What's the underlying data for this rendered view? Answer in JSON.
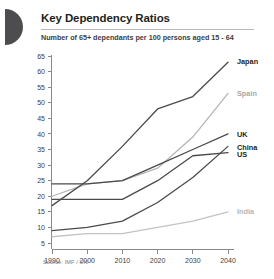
{
  "header": {
    "logo": "half-disc-mark",
    "title": "Key Dependency Ratios",
    "subtitle": "Number of 65+ dependants per 100 persons aged 15 - 64"
  },
  "footer": {
    "source": "Source: IMF / UN"
  },
  "chart_data": {
    "type": "line",
    "title": "Key Dependency Ratios",
    "subtitle": "Number of 65+ dependants per 100 persons aged 15 - 64",
    "xlabel": "",
    "ylabel": "",
    "x": [
      1990,
      2000,
      2010,
      2020,
      2030,
      2040
    ],
    "xtick_labels": [
      "1990",
      "2000",
      "2010",
      "2020",
      "2030",
      "2040"
    ],
    "ytick_labels": [
      "5",
      "10",
      "15",
      "20",
      "25",
      "30",
      "35",
      "40",
      "45",
      "50",
      "55",
      "60",
      "65"
    ],
    "yticks": [
      5,
      10,
      15,
      20,
      25,
      30,
      35,
      40,
      45,
      50,
      55,
      60,
      65
    ],
    "ylim": [
      3,
      67
    ],
    "xlim": [
      1988,
      2042
    ],
    "grid": false,
    "legend_position": "right-inline",
    "series": [
      {
        "name": "Japan",
        "color": "#4a4a4c",
        "values": [
          17,
          25,
          36,
          48,
          52,
          63
        ]
      },
      {
        "name": "Spain",
        "color": "#b5b5b7",
        "values": [
          20,
          24,
          25,
          29,
          39,
          53
        ]
      },
      {
        "name": "UK",
        "color": "#4a4a4c",
        "values": [
          24,
          24,
          25,
          30,
          35,
          40
        ]
      },
      {
        "name": "China",
        "color": "#4a4a4c",
        "values": [
          9,
          10,
          12,
          18,
          26,
          36
        ]
      },
      {
        "name": "US",
        "color": "#4a4a4c",
        "values": [
          19,
          19,
          19,
          25,
          33,
          34
        ]
      },
      {
        "name": "India",
        "color": "#c3c3c5",
        "values": [
          7,
          8,
          8,
          10,
          12,
          15
        ]
      }
    ],
    "labels": [
      {
        "name": "Japan",
        "value_at_2040": 63,
        "color": "#231f20"
      },
      {
        "name": "Spain",
        "value_at_2040": 53,
        "color": "#a8a8aa"
      },
      {
        "name": "UK",
        "value_at_2040": 40,
        "color": "#231f20"
      },
      {
        "name": "China",
        "value_at_2040": 36,
        "color": "#231f20"
      },
      {
        "name": "US",
        "value_at_2040": 34,
        "color": "#231f20"
      },
      {
        "name": "India",
        "value_at_2040": 15,
        "color": "#b6b6b8"
      }
    ]
  }
}
